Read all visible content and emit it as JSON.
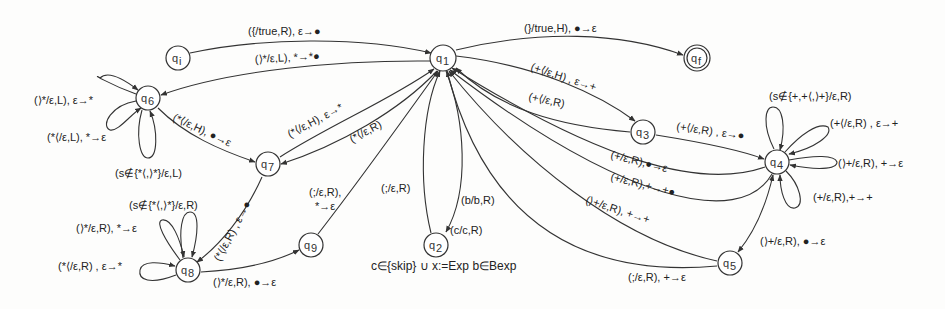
{
  "diagram": {
    "type": "pushdown-automaton",
    "nodes": [
      {
        "id": "qi",
        "label": "q",
        "sub": "i",
        "x": 178,
        "y": 58,
        "accepting": false
      },
      {
        "id": "q1",
        "label": "q",
        "sub": "1",
        "x": 443,
        "y": 58,
        "accepting": false
      },
      {
        "id": "qf",
        "label": "q",
        "sub": "f",
        "x": 697,
        "y": 58,
        "accepting": true
      },
      {
        "id": "q6",
        "label": "q",
        "sub": "6",
        "x": 148,
        "y": 98,
        "accepting": false
      },
      {
        "id": "q3",
        "label": "q",
        "sub": "3",
        "x": 643,
        "y": 132,
        "accepting": false
      },
      {
        "id": "q7",
        "label": "q",
        "sub": "7",
        "x": 268,
        "y": 164,
        "accepting": false
      },
      {
        "id": "q4",
        "label": "q",
        "sub": "4",
        "x": 777,
        "y": 162,
        "accepting": false
      },
      {
        "id": "q9",
        "label": "q",
        "sub": "9",
        "x": 311,
        "y": 245,
        "accepting": false
      },
      {
        "id": "q2",
        "label": "q",
        "sub": "2",
        "x": 436,
        "y": 245,
        "accepting": false
      },
      {
        "id": "q8",
        "label": "q",
        "sub": "8",
        "x": 188,
        "y": 270,
        "accepting": false
      },
      {
        "id": "q5",
        "label": "q",
        "sub": "5",
        "x": 730,
        "y": 263,
        "accepting": false
      }
    ],
    "edges": [
      {
        "from": "qi",
        "to": "q1",
        "label": "({/true,R), ε→●"
      },
      {
        "from": "q1",
        "to": "qf",
        "label": "(}/true,H), ●→ε"
      },
      {
        "from": "q1",
        "to": "q6",
        "label": "(⟩*/ε,L), *→*●"
      },
      {
        "from": "q1",
        "to": "q3",
        "label": "(+⟨/ε,H) , ε→+"
      },
      {
        "from": "q3",
        "to": "q1",
        "label": "(+⟨/ε,R)"
      },
      {
        "from": "q3",
        "to": "q4",
        "label": "(+⟨/ε,R) , ε→●"
      },
      {
        "from": "q6",
        "to": "q7",
        "label": "(*⟨/ε,H), ●→ε"
      },
      {
        "from": "q7",
        "to": "q1",
        "label": "(*⟨/ε,H), ε→*"
      },
      {
        "from": "q1",
        "to": "q7",
        "label": "(*⟨/ε,R)"
      },
      {
        "from": "q7",
        "to": "q8",
        "label": "(*⟨/ε,R) , ε→●"
      },
      {
        "from": "q8",
        "to": "q9",
        "label": "(⟩*/ε,R), ●→ε"
      },
      {
        "from": "q9",
        "to": "q1",
        "label": "(;/ε,R), *→ε"
      },
      {
        "from": "q2",
        "to": "q1",
        "label": "(;/ε,R)"
      },
      {
        "from": "q1",
        "to": "q2",
        "label": "(b/b,R)"
      },
      {
        "from": "q1",
        "to": "q2",
        "label": "(c/c,R)"
      },
      {
        "from": "q4",
        "to": "q1",
        "label": "(+/ε,R),●→ε"
      },
      {
        "from": "q4",
        "to": "q1",
        "label": "(+/ε,R),+→+●"
      },
      {
        "from": "q5",
        "to": "q1",
        "label": "(⟩+/ε,R), +→+"
      },
      {
        "from": "q5",
        "to": "q1",
        "label": "(;/ε,R), +→ε"
      },
      {
        "from": "q4",
        "to": "q5",
        "label": "(⟩+/ε,R), ●→ε"
      }
    ],
    "loops": [
      {
        "node": "q6",
        "label": "(⟩*/ε,L), ε→*"
      },
      {
        "node": "q6",
        "label": "(*⟨/ε,L), *→ε"
      },
      {
        "node": "q6",
        "label": "(s∉{*⟨,⟩*}/ε,L)"
      },
      {
        "node": "q8",
        "label": "(s∉{*⟨,⟩*}/ε,R)"
      },
      {
        "node": "q8",
        "label": "(⟩*/ε,R), *→ε"
      },
      {
        "node": "q8",
        "label": "(*⟨/ε,R) , ε→*"
      },
      {
        "node": "q4",
        "label": "(s∉{+,+⟨,⟩+}/ε,R)"
      },
      {
        "node": "q4",
        "label": "(+⟨/ε,R) , ε→+"
      },
      {
        "node": "q4",
        "label": "(⟩+/ε,R), +→ε"
      },
      {
        "node": "q4",
        "label": "(+/ε,R),+→+"
      }
    ],
    "caption": "c∈{skip} ∪ x:=Exp  b∈Bexp"
  }
}
